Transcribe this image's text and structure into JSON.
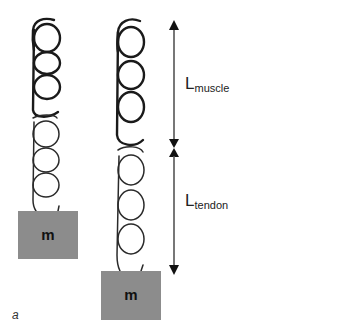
{
  "figure": {
    "panel_label": "a",
    "colors": {
      "spring": "#1a1a1a",
      "mass_fill": "#8c8c8c",
      "arrow": "#222222",
      "arrow_line": "#555555",
      "background": "#ffffff"
    }
  },
  "left_system": {
    "description": "muscle-tendon spring with mass (rest)",
    "muscle_coils": 4,
    "tendon_coils": 4,
    "mass_label": "m"
  },
  "right_system": {
    "description": "muscle-tendon spring with mass (stretched tendon)",
    "muscle_coils": 4,
    "tendon_coils": 3,
    "mass_label": "m"
  },
  "dimensions": {
    "muscle": {
      "main": "L",
      "sub": "muscle"
    },
    "tendon": {
      "main": "L",
      "sub": "tendon"
    }
  }
}
